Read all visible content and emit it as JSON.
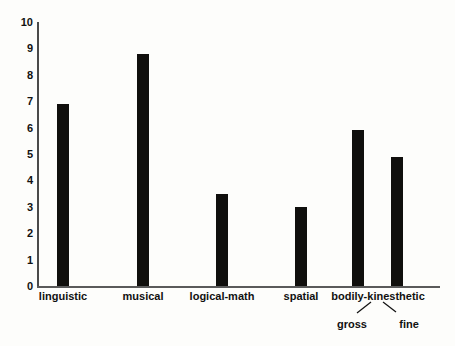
{
  "chart_data": {
    "type": "bar",
    "title": "",
    "subtitle": "",
    "xlabel": "",
    "ylabel": "",
    "categories": [
      "linguistic",
      "musical",
      "logical-math",
      "spatial",
      "gross",
      "fine"
    ],
    "values": [
      6.9,
      8.8,
      3.5,
      3.0,
      5.9,
      4.9
    ],
    "group_labels": [
      {
        "label": "linguistic",
        "x": 63
      },
      {
        "label": "musical",
        "x": 143
      },
      {
        "label": "logical-math",
        "x": 222
      },
      {
        "label": "spatial",
        "x": 301
      },
      {
        "label": "bodily-kinesthetic",
        "x": 378
      }
    ],
    "sub_labels": [
      {
        "label": "gross",
        "x": 352
      },
      {
        "label": "fine",
        "x": 409
      }
    ],
    "bar_positions": [
      63,
      143,
      222,
      301,
      358,
      397
    ],
    "ylim": [
      0,
      10
    ],
    "yticks": [
      0,
      1,
      2,
      3,
      4,
      5,
      6,
      7,
      8,
      9,
      10
    ],
    "ytick_labels": [
      "0",
      "1",
      "2",
      "3",
      "4",
      "5",
      "6",
      "7",
      "8",
      "9",
      "10"
    ],
    "grid": false,
    "legend": "none",
    "bar_color": "#100f0d",
    "axis_color": "#4a4a4a",
    "background_color": "#fdfdfb",
    "text_color": "#111111"
  }
}
